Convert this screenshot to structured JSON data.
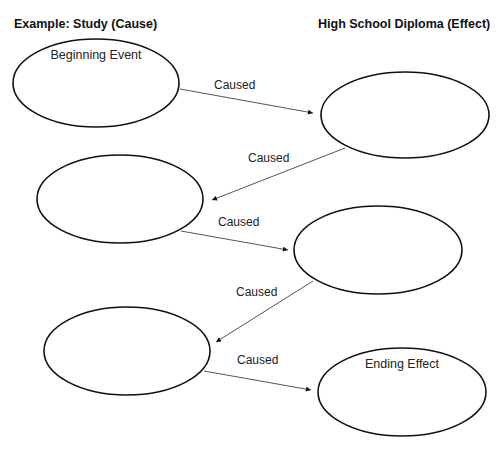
{
  "headers": {
    "left": "Example:  Study  (Cause)",
    "right": "High School Diploma  (Effect)"
  },
  "nodes": [
    {
      "id": "n1",
      "text": "Beginning Event",
      "cx": 96,
      "cy": 83,
      "rx": 83,
      "ry": 44
    },
    {
      "id": "n2",
      "text": "",
      "cx": 405,
      "cy": 115,
      "rx": 84,
      "ry": 43
    },
    {
      "id": "n3",
      "text": "",
      "cx": 120,
      "cy": 199,
      "rx": 83,
      "ry": 44
    },
    {
      "id": "n4",
      "text": "",
      "cx": 378,
      "cy": 250,
      "rx": 84,
      "ry": 44
    },
    {
      "id": "n5",
      "text": "",
      "cx": 127,
      "cy": 351,
      "rx": 83,
      "ry": 44
    },
    {
      "id": "n6",
      "text": "Ending Effect",
      "cx": 402,
      "cy": 392,
      "rx": 84,
      "ry": 44
    }
  ],
  "edges": [
    {
      "from": "n1",
      "to": "n2",
      "label": "Caused",
      "x1": 180,
      "y1": 89,
      "x2": 313,
      "y2": 113,
      "lx": 214,
      "ly": 78
    },
    {
      "from": "n2",
      "to": "n3",
      "label": "Caused",
      "x1": 345,
      "y1": 148,
      "x2": 212,
      "y2": 200,
      "lx": 248,
      "ly": 151
    },
    {
      "from": "n3",
      "to": "n4",
      "label": "Caused",
      "x1": 181,
      "y1": 231,
      "x2": 288,
      "y2": 250,
      "lx": 218,
      "ly": 215
    },
    {
      "from": "n4",
      "to": "n5",
      "label": "Caused",
      "x1": 313,
      "y1": 281,
      "x2": 216,
      "y2": 342,
      "lx": 236,
      "ly": 285
    },
    {
      "from": "n5",
      "to": "n6",
      "label": "Caused",
      "x1": 204,
      "y1": 371,
      "x2": 311,
      "y2": 390,
      "lx": 237,
      "ly": 353
    }
  ],
  "colors": {
    "stroke": "#111111",
    "edge": "#555555",
    "background": "#ffffff"
  }
}
